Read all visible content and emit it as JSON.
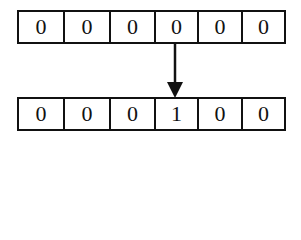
{
  "diagram": {
    "top_row": {
      "cells": [
        "0",
        "0",
        "0",
        "0",
        "0",
        "0"
      ]
    },
    "bottom_row": {
      "cells": [
        "0",
        "0",
        "0",
        "1",
        "0",
        "0"
      ]
    },
    "arrow": {
      "direction": "down",
      "from": "top_row",
      "to": "bottom_row",
      "column_index": 3
    },
    "colors": {
      "stroke": "#111111",
      "background": "#ffffff"
    }
  }
}
